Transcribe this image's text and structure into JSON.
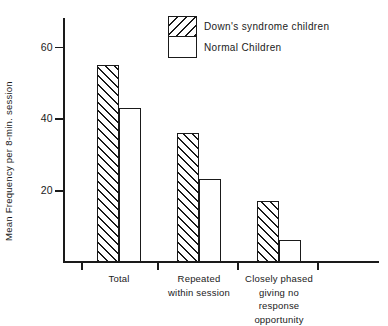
{
  "chart_data": {
    "type": "bar",
    "title": "",
    "xlabel": "",
    "ylabel": "Mean Frequency per 8-min. session",
    "categories": [
      "Total",
      "Repeated\nwithin session",
      "Closely phased\ngiving no\nresponse opportunity"
    ],
    "series": [
      {
        "name": "Down's syndrome children",
        "pattern": "hatched",
        "values": [
          55,
          36,
          17
        ]
      },
      {
        "name": "Normal Children",
        "pattern": "open",
        "values": [
          43,
          23,
          6
        ]
      }
    ],
    "ylim": [
      0,
      68
    ],
    "yticks": [
      20,
      40,
      60
    ],
    "ytick_labels": [
      "20",
      "40",
      "60"
    ],
    "grid": false,
    "legend_position": "top-center"
  },
  "legend": {
    "entries": [
      {
        "label": "Down's syndrome children"
      },
      {
        "label": "Normal Children"
      }
    ]
  },
  "colors": {
    "ink": "#1a1a1a",
    "background": "#ffffff"
  }
}
